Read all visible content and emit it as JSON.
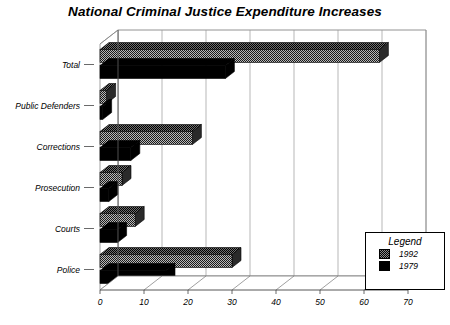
{
  "chart_data": {
    "type": "bar",
    "orientation": "horizontal",
    "title": "National Criminal Justice Expenditure Increases",
    "subtitle": "Billions of Dollars",
    "xlabel": "",
    "ylabel": "",
    "xlim": [
      0,
      70
    ],
    "xticks": [
      0,
      10,
      20,
      30,
      40,
      50,
      60,
      70
    ],
    "grid": true,
    "legend_title": "Legend",
    "legend_position": "bottom-right",
    "categories": [
      "Total",
      "Public Defenders",
      "Corrections",
      "Prosecution",
      "Courts",
      "Police"
    ],
    "series": [
      {
        "name": "1992",
        "color": "#8a8a8a",
        "pattern": "checkered",
        "values": [
          63.5,
          1.5,
          21.0,
          5.0,
          8.0,
          30.0
        ]
      },
      {
        "name": "1979",
        "color": "#000000",
        "pattern": "solid",
        "values": [
          28.5,
          0.6,
          7.0,
          2.0,
          4.0,
          15.0
        ]
      }
    ]
  },
  "legend": {
    "title": "Legend",
    "entries": [
      {
        "label": "1992"
      },
      {
        "label": "1979"
      }
    ]
  }
}
